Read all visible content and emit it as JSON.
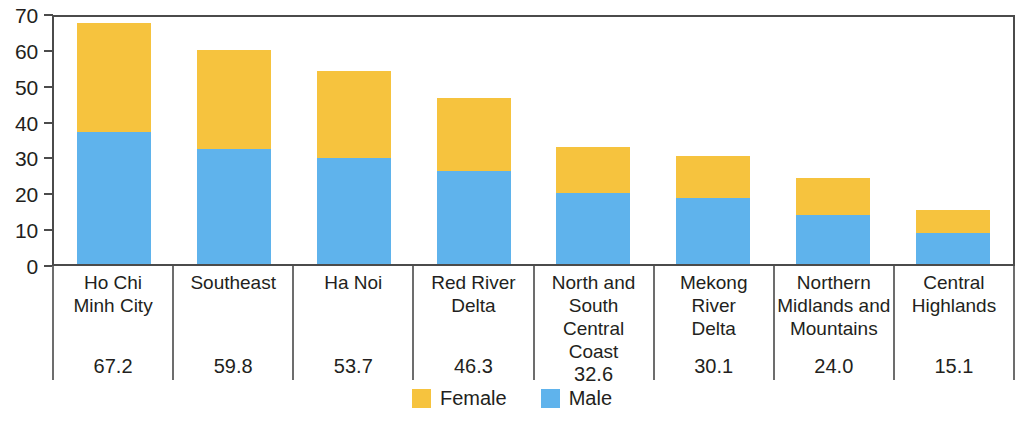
{
  "chart_data": {
    "type": "bar",
    "subtype": "stacked-vertical",
    "title": "",
    "xlabel": "",
    "ylabel": "",
    "ylim": [
      0,
      70
    ],
    "yticks": [
      0,
      10,
      20,
      30,
      40,
      50,
      60,
      70
    ],
    "grid": false,
    "legend_position": "bottom-center",
    "categories": [
      "Ho Chi\nMinh City",
      "Southeast",
      "Ha Noi",
      "Red River\nDelta",
      "North and\nSouth\nCentral Coast",
      "Mekong\nRiver\nDelta",
      "Northern\nMidlands and\nMountains",
      "Central\nHighlands"
    ],
    "series": [
      {
        "name": "Male",
        "color": "#5fb3ec",
        "values": [
          36.7,
          32.2,
          29.6,
          26.0,
          19.9,
          18.3,
          13.8,
          8.7
        ]
      },
      {
        "name": "Female",
        "color": "#f6c33e",
        "values": [
          30.5,
          27.6,
          24.1,
          20.3,
          12.7,
          11.8,
          10.2,
          6.4
        ]
      }
    ],
    "totals": [
      67.2,
      59.8,
      53.7,
      46.3,
      32.6,
      30.1,
      24.0,
      15.1
    ],
    "total_labels": [
      "67.2",
      "59.8",
      "53.7",
      "46.3",
      "32.6",
      "30.1",
      "24.0",
      "15.1"
    ],
    "ytick_labels": [
      "70",
      "60",
      "50",
      "40",
      "30",
      "20",
      "10",
      "0"
    ],
    "legend": [
      {
        "label": "Female",
        "color": "#f6c33e",
        "swatch_name": "legend-swatch-female"
      },
      {
        "label": "Male",
        "color": "#5fb3ec",
        "swatch_name": "legend-swatch-male"
      }
    ]
  }
}
